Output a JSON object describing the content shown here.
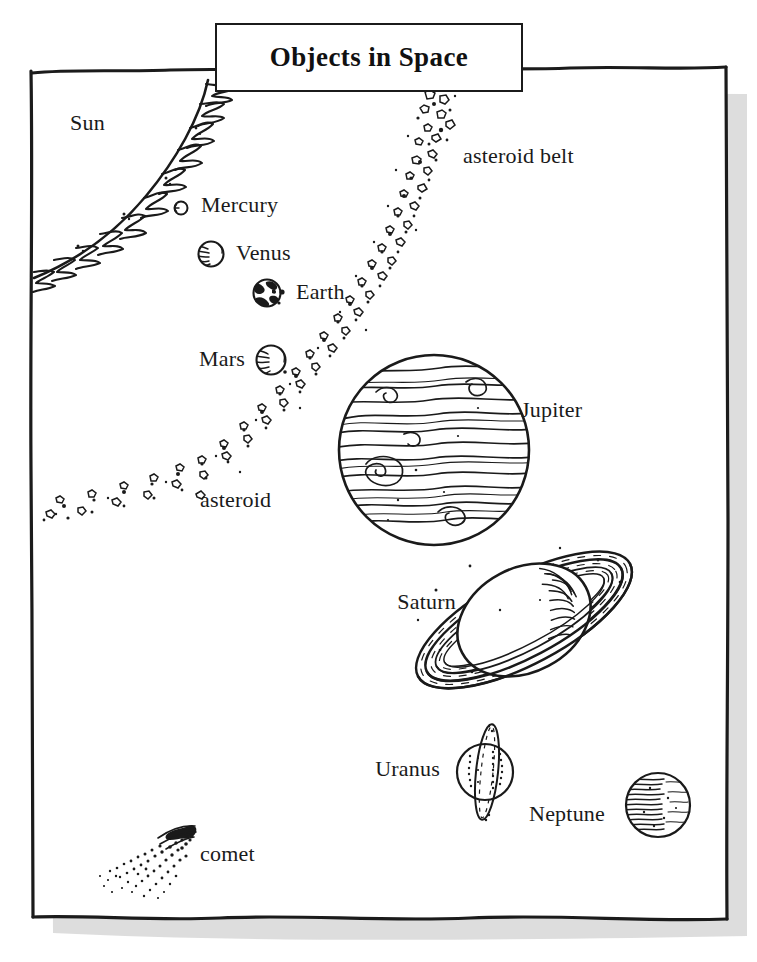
{
  "page": {
    "title": "Objects in Space",
    "width": 757,
    "height": 962,
    "style": "hand-drawn black ink line art on white paper with wavy border and drop shadow",
    "border_color": "#1b1b1b",
    "ink_color": "#1a1a1a",
    "paper_color": "#ffffff",
    "shadow_color": "#cfcfcf"
  },
  "title_box": {
    "label": "Objects in Space",
    "x": 215,
    "y": 23,
    "width": 308,
    "height": 69
  },
  "objects": [
    {
      "name": "Sun",
      "label": "Sun",
      "kind": "star",
      "label_x": 70,
      "label_y": 112,
      "description": "large flame-fringed arc filling the top-left corner"
    },
    {
      "name": "Mercury",
      "label": "Mercury",
      "kind": "planet",
      "cx": 181,
      "cy": 208,
      "r": 7,
      "label_x": 201,
      "label_y": 194
    },
    {
      "name": "Venus",
      "label": "Venus",
      "kind": "planet",
      "cx": 211,
      "cy": 254,
      "r": 13,
      "label_x": 236,
      "label_y": 242
    },
    {
      "name": "Earth",
      "label": "Earth",
      "kind": "planet",
      "cx": 267,
      "cy": 293,
      "r": 14,
      "label_x": 296,
      "label_y": 281
    },
    {
      "name": "Mars",
      "label": "Mars",
      "kind": "planet",
      "cx": 271,
      "cy": 360,
      "r": 15,
      "label_x": 200,
      "label_y": 348,
      "label_align": "right"
    },
    {
      "name": "asteroid belt",
      "label": "asteroid belt",
      "kind": "belt",
      "label_x": 463,
      "label_y": 145
    },
    {
      "name": "asteroid",
      "label": "asteroid",
      "kind": "asteroid",
      "label_x": 200,
      "label_y": 489
    },
    {
      "name": "Jupiter",
      "label": "Jupiter",
      "kind": "planet",
      "cx": 434,
      "cy": 450,
      "r": 96,
      "label_x": 521,
      "label_y": 399
    },
    {
      "name": "Saturn",
      "label": "Saturn",
      "kind": "planet",
      "cx": 524,
      "cy": 620,
      "r": 66,
      "label_x": 392,
      "label_y": 591
    },
    {
      "name": "Uranus",
      "label": "Uranus",
      "kind": "planet",
      "cx": 485,
      "cy": 772,
      "r": 29,
      "label_x": 378,
      "label_y": 758
    },
    {
      "name": "Neptune",
      "label": "Neptune",
      "kind": "planet",
      "cx": 658,
      "cy": 805,
      "r": 33,
      "label_x": 533,
      "label_y": 803
    },
    {
      "name": "comet",
      "label": "comet",
      "kind": "comet",
      "label_x": 200,
      "label_y": 843
    }
  ]
}
